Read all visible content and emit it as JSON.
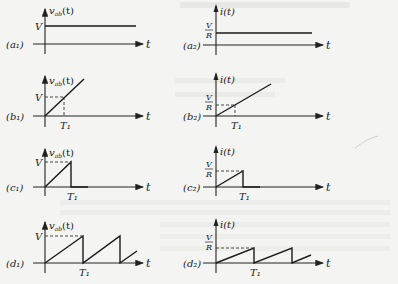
{
  "figure": {
    "panels": [
      {
        "id": "a1",
        "label": "(a₁)",
        "ylabel": "v",
        "ysub": "ab",
        "yfn": "(t)",
        "level": "V",
        "xlabel": "t",
        "tick": "",
        "shape": "step"
      },
      {
        "id": "a2",
        "label": "(a₂)",
        "ylabel": "i(t)",
        "level_num": "V",
        "level_den": "R",
        "xlabel": "t",
        "tick": "",
        "shape": "step"
      },
      {
        "id": "b1",
        "label": "(b₁)",
        "ylabel": "v",
        "ysub": "ab",
        "yfn": "(t)",
        "level": "V",
        "xlabel": "t",
        "tick": "T₁",
        "shape": "ramp"
      },
      {
        "id": "b2",
        "label": "(b₂)",
        "ylabel": "i(t)",
        "level_num": "V",
        "level_den": "R",
        "xlabel": "t",
        "tick": "T₁",
        "shape": "ramp"
      },
      {
        "id": "c1",
        "label": "(c₁)",
        "ylabel": "v",
        "ysub": "ab",
        "yfn": "(t)",
        "level": "V",
        "xlabel": "t",
        "tick": "T₁",
        "shape": "single-sawtooth"
      },
      {
        "id": "c2",
        "label": "(c₂)",
        "ylabel": "i(t)",
        "level_num": "V",
        "level_den": "R",
        "xlabel": "t",
        "tick": "T₁",
        "shape": "single-sawtooth"
      },
      {
        "id": "d1",
        "label": "(d₁)",
        "ylabel": "v",
        "ysub": "ab",
        "yfn": "(t)",
        "level": "V",
        "xlabel": "t",
        "tick": "T₁",
        "shape": "periodic-sawtooth"
      },
      {
        "id": "d2",
        "label": "(d₂)",
        "ylabel": "i(t)",
        "level_num": "V",
        "level_den": "R",
        "xlabel": "t",
        "tick": "T₁",
        "shape": "periodic-sawtooth"
      }
    ]
  }
}
